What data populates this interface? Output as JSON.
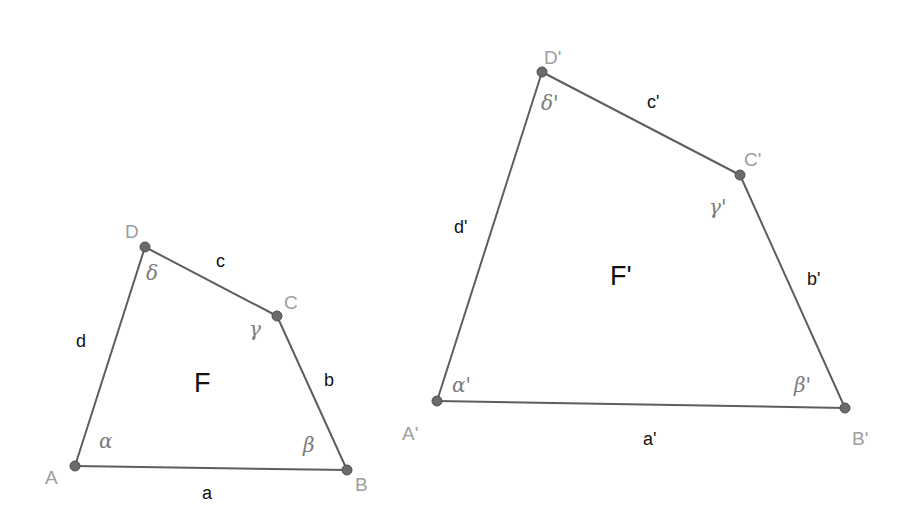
{
  "figures": [
    {
      "name": "F",
      "label": "F",
      "vertices": [
        {
          "id": "A",
          "label": "A",
          "angle": "α"
        },
        {
          "id": "B",
          "label": "B",
          "angle": "β"
        },
        {
          "id": "C",
          "label": "C",
          "angle": "γ"
        },
        {
          "id": "D",
          "label": "D",
          "angle": "δ"
        }
      ],
      "sides": [
        {
          "id": "a",
          "label": "a",
          "from": "A",
          "to": "B"
        },
        {
          "id": "b",
          "label": "b",
          "from": "B",
          "to": "C"
        },
        {
          "id": "c",
          "label": "c",
          "from": "C",
          "to": "D"
        },
        {
          "id": "d",
          "label": "d",
          "from": "D",
          "to": "A"
        }
      ]
    },
    {
      "name": "F-prime",
      "label": "F'",
      "vertices": [
        {
          "id": "A'",
          "label": "A'",
          "angle": "α'"
        },
        {
          "id": "B'",
          "label": "B'",
          "angle": "β'"
        },
        {
          "id": "C'",
          "label": "C'",
          "angle": "γ'"
        },
        {
          "id": "D'",
          "label": "D'",
          "angle": "δ'"
        }
      ],
      "sides": [
        {
          "id": "a'",
          "label": "a'",
          "from": "A'",
          "to": "B'"
        },
        {
          "id": "b'",
          "label": "b'",
          "from": "B'",
          "to": "C'"
        },
        {
          "id": "c'",
          "label": "c'",
          "from": "C'",
          "to": "D'"
        },
        {
          "id": "d'",
          "label": "d'",
          "from": "D'",
          "to": "A'"
        }
      ]
    }
  ],
  "colors": {
    "edge": "#5e5e5e",
    "vertex": "#6b6b6b",
    "point_label": "#9d9d9d",
    "side_label": "#111111",
    "angle_label": "#7a7a7a"
  }
}
